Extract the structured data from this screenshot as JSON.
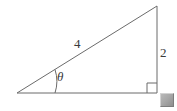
{
  "figure": {
    "type": "right-triangle-diagram",
    "background_color": "#ffffff",
    "stroke_color": "#6b6b6b",
    "label_color": "#3a3a3a"
  },
  "labels": {
    "hypotenuse": "4",
    "opposite_side": "2",
    "angle": "θ"
  },
  "markers": {
    "right_angle_symbol": "right-angle-square",
    "angle_arc": "theta-arc"
  },
  "geometry": {
    "vertex_left": [
      17,
      93
    ],
    "vertex_bottom_right": [
      157,
      93
    ],
    "vertex_top_right": [
      157,
      6
    ],
    "right_angle_box": [
      147,
      83,
      10,
      10
    ],
    "arc_radius": 38
  },
  "handle": {
    "name": "resize-handle",
    "color": "#a0a0a0"
  }
}
